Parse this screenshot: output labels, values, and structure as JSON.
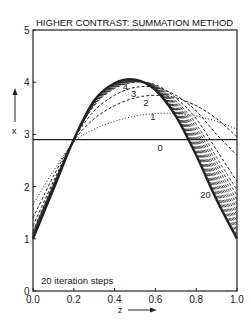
{
  "chart_data": {
    "type": "line",
    "title": "HIGHER CONTRAST: SUMMATION METHOD",
    "xlabel": "z",
    "ylabel": "x",
    "xlim": [
      0.0,
      1.0
    ],
    "ylim": [
      0,
      5
    ],
    "x_ticks": [
      "0.0",
      "0.2",
      "0.4",
      "0.6",
      "0.8",
      "1.0"
    ],
    "y_ticks": [
      "0",
      "1",
      "2",
      "3",
      "4",
      "5"
    ],
    "grid": false,
    "annotation": "20 iteration steps",
    "x": [
      0.0,
      0.1,
      0.2,
      0.3,
      0.4,
      0.5,
      0.6,
      0.7,
      0.8,
      0.9,
      1.0
    ],
    "series": [
      {
        "name": "0",
        "label": "0",
        "style": "solid",
        "values": [
          2.9,
          2.9,
          2.9,
          2.9,
          2.9,
          2.9,
          2.9,
          2.9,
          2.9,
          2.9,
          2.9
        ]
      },
      {
        "name": "1",
        "label": "1",
        "style": "dotted",
        "values": [
          1.65,
          2.3,
          2.85,
          3.1,
          3.25,
          3.35,
          3.4,
          3.4,
          3.35,
          3.25,
          3.1
        ]
      },
      {
        "name": "2",
        "label": "2",
        "style": "dashed",
        "values": [
          1.4,
          2.2,
          2.88,
          3.3,
          3.55,
          3.7,
          3.75,
          3.7,
          3.55,
          3.3,
          2.95
        ]
      },
      {
        "name": "3",
        "label": "3",
        "style": "dashed",
        "values": [
          1.25,
          2.1,
          2.9,
          3.45,
          3.75,
          3.9,
          3.9,
          3.75,
          3.45,
          3.0,
          2.6
        ]
      },
      {
        "name": "4",
        "label": "4",
        "style": "dashed",
        "values": [
          1.15,
          2.05,
          2.9,
          3.55,
          3.88,
          4.0,
          3.95,
          3.7,
          3.3,
          2.7,
          2.1
        ]
      },
      {
        "name": "20",
        "label": "20",
        "style": "solid-bold",
        "values": [
          1.0,
          1.95,
          2.9,
          3.65,
          3.98,
          4.05,
          3.85,
          3.35,
          2.6,
          1.75,
          1.0
        ]
      }
    ]
  },
  "labels": {
    "title": "HIGHER CONTRAST: SUMMATION METHOD",
    "xlabel": "z",
    "ylabel": "x",
    "annotation": "20 iteration steps",
    "curve_labels": [
      "0",
      "1",
      "2",
      "3",
      "4",
      "20"
    ]
  }
}
